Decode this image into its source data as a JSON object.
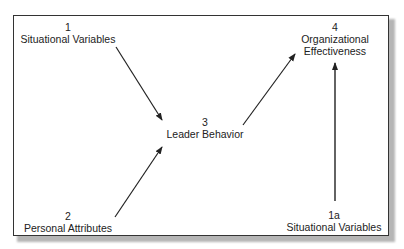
{
  "diagram": {
    "nodes": [
      {
        "id": "n1",
        "number": "1",
        "label": "Situational Variables"
      },
      {
        "id": "n2",
        "number": "2",
        "label": "Personal Attributes"
      },
      {
        "id": "n3",
        "number": "3",
        "label": "Leader Behavior"
      },
      {
        "id": "n4",
        "number": "4",
        "label_line1": "Organizational",
        "label_line2": "Effectiveness"
      },
      {
        "id": "n1a",
        "number": "1a",
        "label": "Situational Variables"
      }
    ],
    "edges": [
      {
        "from": "n1",
        "to": "n3"
      },
      {
        "from": "n2",
        "to": "n3"
      },
      {
        "from": "n3",
        "to": "n4"
      },
      {
        "from": "n1a",
        "to": "n4"
      }
    ],
    "colors": {
      "line": "#222222",
      "border": "#333333",
      "shadow": "#b5b5b5"
    }
  }
}
